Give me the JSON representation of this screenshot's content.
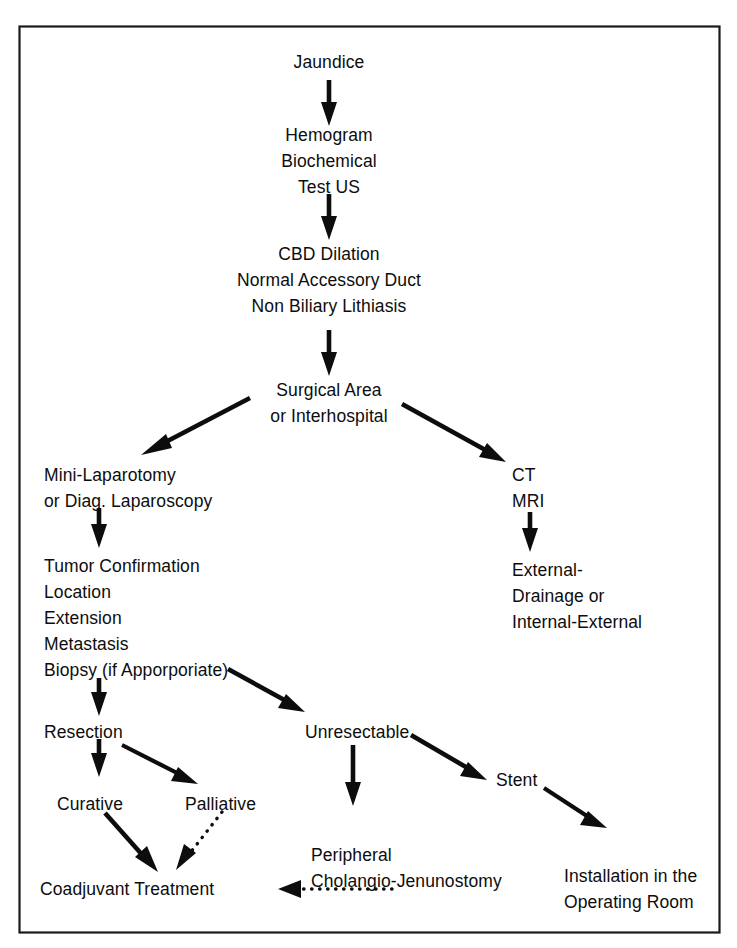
{
  "figure": {
    "type": "flowchart",
    "orientation": "top-to-bottom",
    "border_color": "#1a1a1a",
    "background_color": "#ffffff",
    "text_color": "#0d0d0d"
  },
  "nodes": {
    "jaundice": {
      "id": "jaundice",
      "lines": [
        "Jaundice"
      ]
    },
    "hemogram": {
      "id": "hemogram",
      "lines": [
        "Hemogram",
        "Biochemical",
        "Test US"
      ]
    },
    "cbd": {
      "id": "cbd",
      "lines": [
        "CBD Dilation",
        "Normal Accessory Duct",
        "Non Biliary Lithiasis"
      ]
    },
    "surgical_area": {
      "id": "surgical_area",
      "lines": [
        "Surgical Area",
        "or Interhospital"
      ]
    },
    "mini_lap": {
      "id": "mini_lap",
      "lines": [
        "Mini-Laparotomy",
        "or Diag. Laparoscopy"
      ]
    },
    "ct_mri": {
      "id": "ct_mri",
      "lines": [
        "CT",
        "MRI"
      ]
    },
    "tumor_conf": {
      "id": "tumor_conf",
      "lines": [
        "Tumor Confirmation",
        "Location",
        "Extension",
        "Metastasis",
        "Biopsy (if Apporporiate)"
      ]
    },
    "external_drain": {
      "id": "external_drain",
      "lines": [
        "External-",
        "Drainage or",
        "Internal-External"
      ]
    },
    "resection": {
      "id": "resection",
      "lines": [
        "Resection"
      ]
    },
    "unresectable": {
      "id": "unresectable",
      "lines": [
        "Unresectable"
      ]
    },
    "curative": {
      "id": "curative",
      "lines": [
        "Curative"
      ]
    },
    "palliative": {
      "id": "palliative",
      "lines": [
        "Palliative"
      ]
    },
    "stent": {
      "id": "stent",
      "lines": [
        "Stent"
      ]
    },
    "coadjuvant": {
      "id": "coadjuvant",
      "lines": [
        "Coadjuvant Treatment"
      ]
    },
    "peripheral": {
      "id": "peripheral",
      "lines": [
        "Peripheral",
        "Cholangio-Jenunostomy"
      ]
    },
    "installation": {
      "id": "installation",
      "lines": [
        "Installation in the",
        "Operating Room"
      ]
    }
  },
  "edges": [
    {
      "from": "jaundice",
      "to": "hemogram",
      "style": "solid",
      "direction": "down"
    },
    {
      "from": "hemogram",
      "to": "cbd",
      "style": "solid",
      "direction": "down"
    },
    {
      "from": "cbd",
      "to": "surgical_area",
      "style": "solid",
      "direction": "down"
    },
    {
      "from": "surgical_area",
      "to": "mini_lap",
      "style": "solid",
      "direction": "down-left"
    },
    {
      "from": "surgical_area",
      "to": "ct_mri",
      "style": "solid",
      "direction": "down-right"
    },
    {
      "from": "mini_lap",
      "to": "tumor_conf",
      "style": "solid",
      "direction": "down"
    },
    {
      "from": "ct_mri",
      "to": "external_drain",
      "style": "solid",
      "direction": "down"
    },
    {
      "from": "tumor_conf",
      "to": "resection",
      "style": "solid",
      "direction": "down"
    },
    {
      "from": "tumor_conf",
      "to": "unresectable",
      "style": "solid",
      "direction": "down-right"
    },
    {
      "from": "resection",
      "to": "curative",
      "style": "solid",
      "direction": "down"
    },
    {
      "from": "resection",
      "to": "palliative",
      "style": "solid",
      "direction": "down-right"
    },
    {
      "from": "unresectable",
      "to": "peripheral",
      "style": "solid",
      "direction": "down"
    },
    {
      "from": "unresectable",
      "to": "stent",
      "style": "solid",
      "direction": "down-right"
    },
    {
      "from": "stent",
      "to": "installation",
      "style": "solid",
      "direction": "down-right"
    },
    {
      "from": "curative",
      "to": "coadjuvant",
      "style": "solid",
      "direction": "down-right"
    },
    {
      "from": "palliative",
      "to": "coadjuvant",
      "style": "dotted",
      "direction": "down-left"
    },
    {
      "from": "peripheral",
      "to": "coadjuvant",
      "style": "dotted",
      "direction": "left"
    }
  ]
}
